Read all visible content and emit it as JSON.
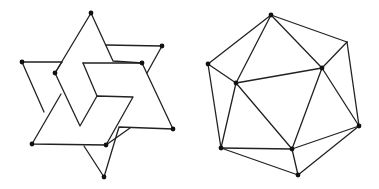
{
  "figures": [
    {
      "name": "interlocking-star",
      "stroke_color": "#222222",
      "vertex_color": "#111111",
      "dots": [
        [
          91,
          13
        ],
        [
          22,
          62
        ],
        [
          55,
          73
        ],
        [
          162,
          46
        ],
        [
          142,
          63
        ],
        [
          173,
          129
        ],
        [
          32,
          144
        ],
        [
          106,
          145
        ],
        [
          104,
          177
        ]
      ],
      "paths": [
        "M91,13 L55,73 L80,126 L97,96 L133,97 L106,145 L32,144 L61,94",
        "M91,13 L113,61 L142,63 L173,129 L119,127 L104,177 L84,146",
        "M22,62 L62,62 M22,62 L44,112",
        "M106,45 L162,46 L147,73",
        "M83,63 L142,63",
        "M83,63 L97,96",
        "M130,128 L106,145",
        "M55,73 L62,62"
      ]
    },
    {
      "name": "icosahedron-projection",
      "stroke_color": "#222222",
      "vertex_color": "#111111",
      "dots": [
        [
          271,
          15
        ],
        [
          208,
          64
        ],
        [
          236,
          83
        ],
        [
          322,
          68
        ],
        [
          359,
          126
        ],
        [
          221,
          148
        ],
        [
          292,
          149
        ],
        [
          298,
          175
        ]
      ],
      "edges": [
        [
          [
            271,
            15
          ],
          [
            208,
            64
          ]
        ],
        [
          [
            271,
            15
          ],
          [
            236,
            83
          ]
        ],
        [
          [
            271,
            15
          ],
          [
            322,
            68
          ]
        ],
        [
          [
            271,
            15
          ],
          [
            347,
            42
          ]
        ],
        [
          [
            208,
            64
          ],
          [
            236,
            83
          ]
        ],
        [
          [
            208,
            64
          ],
          [
            221,
            148
          ]
        ],
        [
          [
            236,
            83
          ],
          [
            322,
            68
          ]
        ],
        [
          [
            236,
            83
          ],
          [
            221,
            148
          ]
        ],
        [
          [
            236,
            83
          ],
          [
            292,
            149
          ]
        ],
        [
          [
            322,
            68
          ],
          [
            347,
            42
          ]
        ],
        [
          [
            322,
            68
          ],
          [
            359,
            126
          ]
        ],
        [
          [
            322,
            68
          ],
          [
            292,
            149
          ]
        ],
        [
          [
            347,
            42
          ],
          [
            359,
            126
          ]
        ],
        [
          [
            359,
            126
          ],
          [
            292,
            149
          ]
        ],
        [
          [
            359,
            126
          ],
          [
            298,
            175
          ]
        ],
        [
          [
            221,
            148
          ],
          [
            292,
            149
          ]
        ],
        [
          [
            221,
            148
          ],
          [
            298,
            175
          ]
        ],
        [
          [
            292,
            149
          ],
          [
            298,
            175
          ]
        ]
      ]
    }
  ]
}
